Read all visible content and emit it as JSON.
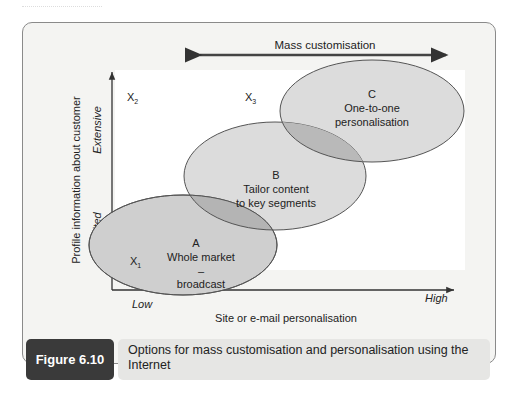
{
  "figure": {
    "number_label": "Figure 6.10",
    "caption": "Options for mass customisation and personalisation using the Internet"
  },
  "diagram": {
    "top_arrow_label": "Mass customisation",
    "y_axis_title": "Profile information about customer",
    "y_low": "Limited",
    "y_high": "Extensive",
    "x_axis_title": "Site or e-mail personalisation",
    "x_low": "Low",
    "x_high": "High",
    "points": {
      "x1": {
        "base": "X",
        "sub": "1"
      },
      "x2": {
        "base": "X",
        "sub": "2"
      },
      "x3": {
        "base": "X",
        "sub": "3"
      }
    },
    "ellipses": {
      "a": {
        "letter": "A",
        "line1": "Whole market",
        "line2": "–",
        "line3": "broadcast"
      },
      "b": {
        "letter": "B",
        "line1": "Tailor content",
        "line2": "to key segments"
      },
      "c": {
        "letter": "C",
        "line1": "One-to-one",
        "line2": "personalisation"
      }
    },
    "colors": {
      "ellipse_fill": "#d9d9d9",
      "overlap_fill": "#b8b8b8",
      "caption_dark": "#3a3a3a",
      "caption_light": "#e6e6e4"
    }
  }
}
